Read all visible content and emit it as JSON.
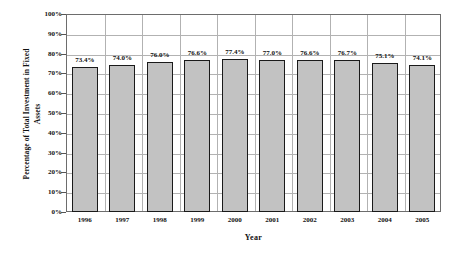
{
  "chart_data": {
    "type": "bar",
    "title": "",
    "xlabel": "Year",
    "ylabel_line1": "Percentage of Total Investment in Fixed",
    "ylabel_line2": "Assets",
    "categories": [
      "1996",
      "1997",
      "1998",
      "1999",
      "2000",
      "2001",
      "2002",
      "2003",
      "2004",
      "2005"
    ],
    "values": [
      73.4,
      74.0,
      76.0,
      76.6,
      77.4,
      77.0,
      76.6,
      76.7,
      75.1,
      74.1
    ],
    "value_labels": [
      "73.4%",
      "74.0%",
      "76.0%",
      "76.6%",
      "77.4%",
      "77.0%",
      "76.6%",
      "76.7%",
      "75.1%",
      "74.1%"
    ],
    "ylim": [
      0,
      100
    ],
    "ytick_labels": [
      "100%",
      "90%",
      "80%",
      "70%",
      "60%",
      "50%",
      "40%",
      "30%",
      "20%",
      "10%",
      "0%"
    ],
    "ytick_values": [
      100,
      90,
      80,
      70,
      60,
      50,
      40,
      30,
      20,
      10,
      0
    ],
    "grid": true,
    "legend": "none",
    "colors": {
      "bar_fill": "#c2c2c2",
      "bar_border": "#1a1a1a",
      "grid": "#b2b2b2",
      "frame": "#6d6d6d",
      "text": "#111111",
      "background": "#ffffff"
    }
  }
}
